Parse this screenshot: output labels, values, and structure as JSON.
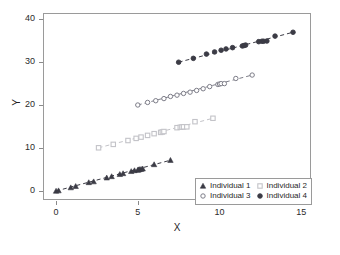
{
  "chart_data": {
    "type": "scatter",
    "title": "",
    "xlabel": "X",
    "ylabel": "Y",
    "xlim": [
      -0.8,
      15.6
    ],
    "ylim": [
      -2.2,
      41.5
    ],
    "xticks": [
      0,
      5,
      10,
      15
    ],
    "yticks": [
      0,
      10,
      20,
      30,
      40
    ],
    "xtick_labels": [
      "0",
      "5",
      "10",
      "15"
    ],
    "ytick_labels": [
      "0",
      "10",
      "20",
      "30",
      "40"
    ],
    "grid": false,
    "legend_position": "lower right",
    "series": [
      {
        "name": "Individual 1",
        "marker": "triangle",
        "color": "#3b3b45",
        "line_style": "dashed",
        "x": [
          0.0,
          0.15,
          0.9,
          1.2,
          2.0,
          2.3,
          3.1,
          3.4,
          3.9,
          4.1,
          4.6,
          4.8,
          5.0,
          5.05,
          5.1,
          5.2,
          5.3,
          6.0,
          7.0
        ],
        "y": [
          -0.1,
          0.0,
          0.7,
          1.0,
          1.9,
          2.1,
          3.0,
          3.3,
          3.8,
          4.0,
          4.5,
          4.7,
          4.8,
          4.9,
          4.95,
          5.0,
          5.1,
          6.1,
          7.1
        ]
      },
      {
        "name": "Individual 2",
        "marker": "square",
        "color": "#c3c3c8",
        "line_style": "dashed",
        "x": [
          2.6,
          3.5,
          4.4,
          4.9,
          5.2,
          5.6,
          6.0,
          6.4,
          6.5,
          6.6,
          7.4,
          7.6,
          7.7,
          7.8,
          8.0,
          8.5,
          9.6
        ],
        "y": [
          10.0,
          10.8,
          11.7,
          12.2,
          12.5,
          12.9,
          13.3,
          13.6,
          13.7,
          13.8,
          14.7,
          14.8,
          14.85,
          14.9,
          14.9,
          16.1,
          16.9
        ]
      },
      {
        "name": "Individual 3",
        "marker": "circle-open",
        "color": "#7d7d88",
        "line_style": "dashed",
        "x": [
          5.0,
          5.6,
          6.1,
          6.6,
          7.0,
          7.4,
          7.8,
          8.2,
          8.6,
          9.0,
          9.4,
          9.9,
          10.0,
          10.1,
          10.3,
          11.0,
          12.0
        ],
        "y": [
          20.0,
          20.6,
          21.0,
          21.5,
          22.0,
          22.3,
          22.7,
          23.0,
          23.4,
          23.8,
          24.3,
          24.8,
          24.9,
          25.0,
          25.0,
          26.2,
          27.0
        ]
      },
      {
        "name": "Individual 4",
        "marker": "circle",
        "color": "#3b3b45",
        "line_style": "dashed",
        "x": [
          7.5,
          8.4,
          9.2,
          9.7,
          10.1,
          10.4,
          10.8,
          11.4,
          11.5,
          11.6,
          12.4,
          12.6,
          12.7,
          12.9,
          13.4,
          14.5
        ],
        "y": [
          30.0,
          30.9,
          31.9,
          32.4,
          32.8,
          33.1,
          33.4,
          33.8,
          33.9,
          34.0,
          34.8,
          34.9,
          34.9,
          34.95,
          36.1,
          37.0
        ]
      }
    ]
  },
  "legend": {
    "entries": [
      {
        "label": "Individual 1"
      },
      {
        "label": "Individual 2"
      },
      {
        "label": "Individual 3"
      },
      {
        "label": "Individual 4"
      }
    ]
  }
}
